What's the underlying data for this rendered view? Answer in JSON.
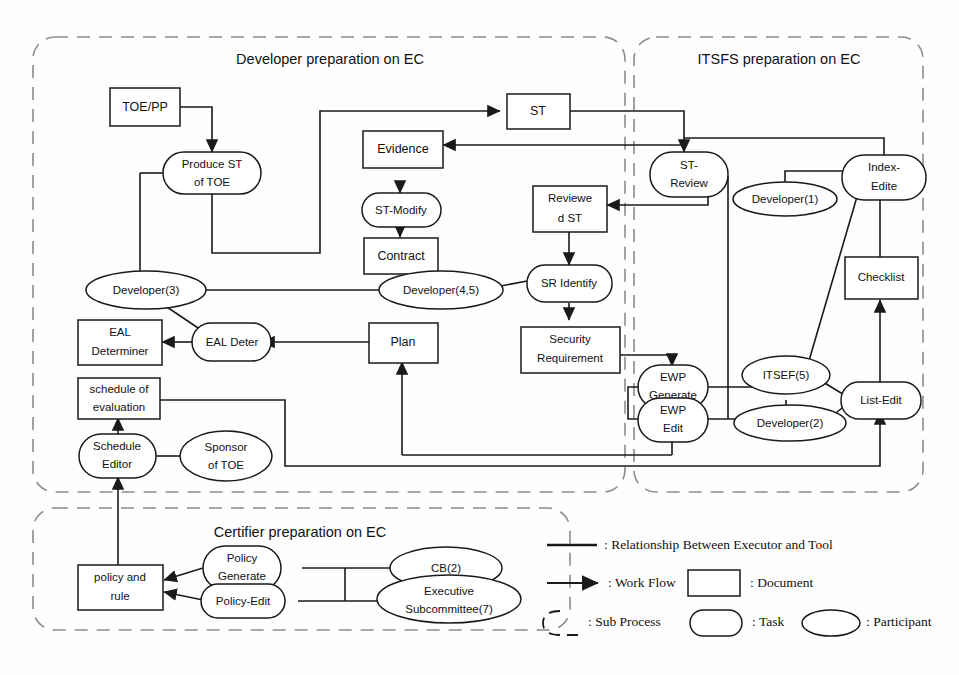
{
  "diagram": {
    "groups": [
      {
        "id": "dev",
        "label": "Developer preparation on EC"
      },
      {
        "id": "itsfs",
        "label": "ITSFS preparation on EC"
      },
      {
        "id": "cert",
        "label": "Certifier preparation on EC"
      }
    ],
    "documents": [
      {
        "id": "toepp",
        "label": "TOE/PP"
      },
      {
        "id": "st",
        "label": "ST"
      },
      {
        "id": "evidence",
        "label": "Evidence"
      },
      {
        "id": "contract",
        "label": "Contract"
      },
      {
        "id": "reviewedst",
        "label": "Reviewe\nd ST"
      },
      {
        "id": "plan",
        "label": "Plan"
      },
      {
        "id": "secreq",
        "label": "Security\nRequirement"
      },
      {
        "id": "ealdet",
        "label": "EAL\nDeterminer"
      },
      {
        "id": "schedeval",
        "label": "schedule of\nevaluation"
      },
      {
        "id": "checklist",
        "label": "Checklist"
      },
      {
        "id": "policyrule",
        "label": "policy and\nrule"
      }
    ],
    "tasks": [
      {
        "id": "producest",
        "label": "Produce ST\nof TOE"
      },
      {
        "id": "stmodify",
        "label": "ST-Modify"
      },
      {
        "id": "sridentify",
        "label": "SR Identify"
      },
      {
        "id": "ealdeter",
        "label": "EAL Deter"
      },
      {
        "id": "streview",
        "label": "ST-\nReview"
      },
      {
        "id": "indexedite",
        "label": "Index-\nEdite"
      },
      {
        "id": "ewpgenerate",
        "label": "EWP\nGenerate"
      },
      {
        "id": "ewpedit",
        "label": "EWP\nEdit"
      },
      {
        "id": "listedit",
        "label": "List-Edit"
      },
      {
        "id": "scheduleeditor",
        "label": "Schedule\nEditor"
      },
      {
        "id": "policygenerate",
        "label": "Policy\nGenerate"
      },
      {
        "id": "policyedit",
        "label": "Policy-Edit"
      }
    ],
    "participants": [
      {
        "id": "dev3",
        "label": "Developer(3)"
      },
      {
        "id": "dev45",
        "label": "Developer(4,5)"
      },
      {
        "id": "dev1",
        "label": "Developer(1)"
      },
      {
        "id": "dev2",
        "label": "Developer(2)"
      },
      {
        "id": "itsef5",
        "label": "ITSEF(5)"
      },
      {
        "id": "sponsor",
        "label": "Sponsor\nof TOE"
      },
      {
        "id": "cb2",
        "label": "CB(2)"
      },
      {
        "id": "execsub",
        "label": "Executive\nSubcommittee(7)"
      }
    ]
  },
  "legend": {
    "items": [
      {
        "id": "relationship",
        "symbol": "thick-line",
        "label": ": Relationship Between Executor and Tool"
      },
      {
        "id": "workflow",
        "symbol": "arrow",
        "label": ": Work Flow"
      },
      {
        "id": "document",
        "symbol": "rectangle",
        "label": ": Document"
      },
      {
        "id": "subprocess",
        "symbol": "dashed-rounded",
        "label": ": Sub Process"
      },
      {
        "id": "task",
        "symbol": "rounded-rect",
        "label": ": Task"
      },
      {
        "id": "participant",
        "symbol": "ellipse",
        "label": ": Participant"
      }
    ]
  },
  "labels": {
    "toepp": "TOE/PP",
    "st": "ST",
    "evidence": "Evidence",
    "contract": "Contract",
    "reviewedst_1": "Reviewe",
    "reviewedst_2": "d ST",
    "plan": "Plan",
    "secreq_1": "Security",
    "secreq_2": "Requirement",
    "ealdet_1": "EAL",
    "ealdet_2": "Determiner",
    "sched_1": "schedule of",
    "sched_2": "evaluation",
    "checklist": "Checklist",
    "policy_1": "policy and",
    "policy_2": "rule",
    "produce_1": "Produce ST",
    "produce_2": "of TOE",
    "stmodify": "ST-Modify",
    "sridentify": "SR Identify",
    "ealdeter": "EAL Deter",
    "streview_1": "ST-",
    "streview_2": "Review",
    "index_1": "Index-",
    "index_2": "Edite",
    "ewpgen_1": "EWP",
    "ewpgen_2": "Generate",
    "ewpedit_1": "EWP",
    "ewpedit_2": "Edit",
    "listedit": "List-Edit",
    "schededitor_1": "Schedule",
    "schededitor_2": "Editor",
    "policygen_1": "Policy",
    "policygen_2": "Generate",
    "policyedit": "Policy-Edit",
    "dev3": "Developer(3)",
    "dev45": "Developer(4,5)",
    "dev1": "Developer(1)",
    "dev2": "Developer(2)",
    "itsef5": "ITSEF(5)",
    "sponsor_1": "Sponsor",
    "sponsor_2": "of TOE",
    "cb2": "CB(2)",
    "exec_1": "Executive",
    "exec_2": "Subcommittee(7)",
    "group_dev": "Developer preparation on EC",
    "group_itsfs": "ITSFS preparation on EC",
    "group_cert": "Certifier preparation on EC",
    "leg_rel": ": Relationship Between Executor and Tool",
    "leg_wf": ": Work Flow",
    "leg_doc": ": Document",
    "leg_sub": ": Sub Process",
    "leg_task": ": Task",
    "leg_part": ": Participant"
  },
  "colors": {
    "stroke": "#1a1a1a",
    "subprocess": "#8c8c8c",
    "background": "#ffffff"
  }
}
